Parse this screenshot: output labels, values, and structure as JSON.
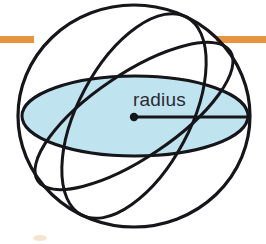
{
  "figure": {
    "name": "sphere-radius-diagram",
    "type": "geometry-illustration",
    "background_color": "#ffffff"
  },
  "labels": {
    "radius": "radius"
  },
  "colors": {
    "ink": "#16161a",
    "disk_fill": "#bfe4f0",
    "accent_rule": "#e8943f",
    "label_text": "#2b2b2f",
    "bullet_faint": "#f2d9bd"
  },
  "geometry": {
    "sphere": {
      "center_x": 134,
      "center_y": 116,
      "radius_x": 116,
      "radius_y": 111,
      "stroke_width": 3.2
    },
    "equatorial_disk": {
      "center_x": 135,
      "center_y": 116,
      "radius_x": 113,
      "radius_y": 40,
      "stroke_width": 3.0,
      "filled": true
    },
    "great_circle_a": {
      "center_x": 134,
      "center_y": 116,
      "radius_x": 116,
      "radius_y": 42,
      "rotation_deg": -34,
      "stroke_width": 3.0
    },
    "great_circle_b": {
      "center_x": 134,
      "center_y": 116,
      "radius_x": 112,
      "radius_y": 56,
      "rotation_deg": -62,
      "stroke_width": 3.0
    },
    "radius_segment": {
      "from_x": 134,
      "from_y": 117,
      "to_x": 248,
      "to_y": 117,
      "stroke_width": 3.0,
      "dot_radius": 4.2
    },
    "label_position": {
      "x": 133,
      "y": 106
    }
  },
  "accent_rule": {
    "y": 39,
    "height": 7,
    "x_start": 0,
    "x_end": 266
  },
  "bullet_mark": {
    "x": 40,
    "y": 238,
    "radius_x": 7,
    "radius_y": 3
  }
}
